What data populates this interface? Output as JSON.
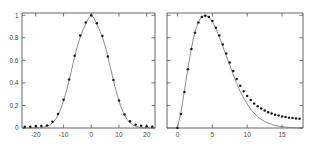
{
  "figure": {
    "background": "#ffffff",
    "curve_color": "#777777",
    "point_color": "#1a1a1a",
    "axis_color": "#555555",
    "width": 319,
    "height": 150
  },
  "chart_data": [
    {
      "type": "scatter",
      "panel": "left",
      "title": "",
      "xlabel": "",
      "ylabel": "",
      "xlim": [
        -25,
        23
      ],
      "ylim": [
        0,
        1.02
      ],
      "grid": false,
      "legend": null,
      "xticks": [
        -20,
        -10,
        0,
        10,
        20
      ],
      "xtick_labels": [
        "-20",
        "-10",
        "0",
        "10",
        "20"
      ],
      "yticks": [
        0,
        0.2,
        0.4,
        0.6,
        0.8,
        1
      ],
      "ytick_labels": [
        "0",
        "0.2",
        "0.4",
        "0.6",
        "0.8",
        "1"
      ],
      "series": [
        {
          "name": "model curve",
          "style": "line",
          "x": [
            -25,
            -24,
            -23,
            -22,
            -21,
            -20,
            -19,
            -18,
            -17,
            -16,
            -15,
            -14,
            -13,
            -12,
            -11,
            -10,
            -9,
            -8,
            -7,
            -6,
            -5,
            -4,
            -3,
            -2,
            -1,
            0,
            1,
            2,
            3,
            4,
            5,
            6,
            7,
            8,
            9,
            10,
            11,
            12,
            13,
            14,
            15,
            16,
            17,
            18,
            19,
            20,
            21,
            22,
            23
          ],
          "y": [
            0.0,
            0.0,
            0.0,
            0.0,
            0.001,
            0.001,
            0.002,
            0.004,
            0.008,
            0.015,
            0.027,
            0.046,
            0.074,
            0.114,
            0.169,
            0.24,
            0.325,
            0.423,
            0.527,
            0.631,
            0.726,
            0.806,
            0.868,
            0.923,
            0.974,
            1.0,
            0.974,
            0.923,
            0.868,
            0.806,
            0.726,
            0.631,
            0.527,
            0.423,
            0.325,
            0.24,
            0.169,
            0.114,
            0.074,
            0.046,
            0.027,
            0.015,
            0.008,
            0.004,
            0.002,
            0.001,
            0.001,
            0.0,
            0.0
          ]
        },
        {
          "name": "measured data",
          "style": "points",
          "x": [
            -24,
            -22,
            -20,
            -18,
            -16,
            -14,
            -12,
            -10,
            -8,
            -6,
            -4,
            -2,
            0,
            2,
            4,
            6,
            8,
            10,
            12,
            14,
            16,
            18,
            20,
            22
          ],
          "y": [
            0.01,
            0.012,
            0.015,
            0.018,
            0.022,
            0.055,
            0.125,
            0.25,
            0.43,
            0.64,
            0.82,
            0.935,
            1.0,
            0.93,
            0.815,
            0.635,
            0.425,
            0.245,
            0.12,
            0.06,
            0.028,
            0.02,
            0.016,
            0.012
          ]
        }
      ]
    },
    {
      "type": "scatter",
      "panel": "right",
      "title": "",
      "xlabel": "",
      "ylabel": "",
      "xlim": [
        -1.5,
        18
      ],
      "ylim": [
        0,
        1.02
      ],
      "grid": false,
      "legend": null,
      "xticks": [
        0,
        5,
        10,
        15
      ],
      "xtick_labels": [
        "0",
        "5",
        "10",
        "15"
      ],
      "yticks": [
        0,
        0.2,
        0.4,
        0.6,
        0.8,
        1
      ],
      "ytick_labels": [
        "",
        "",
        "",
        "",
        "",
        ""
      ],
      "series": [
        {
          "name": "model curve",
          "style": "line",
          "x": [
            -1.0,
            -0.5,
            0.0,
            0.5,
            1.0,
            1.5,
            2.0,
            2.5,
            3.0,
            3.5,
            4.0,
            4.5,
            5.0,
            5.5,
            6.0,
            6.5,
            7.0,
            7.5,
            8.0,
            8.5,
            9.0,
            9.5,
            10.0,
            10.5,
            11.0,
            11.5,
            12.0,
            12.5,
            13.0,
            13.5,
            14.0,
            14.5,
            15.0,
            15.5,
            16.0,
            16.5,
            17.0,
            17.5,
            18.0
          ],
          "y": [
            0.0,
            0.0,
            0.0,
            0.14,
            0.33,
            0.53,
            0.71,
            0.85,
            0.94,
            0.99,
            1.0,
            0.985,
            0.945,
            0.885,
            0.81,
            0.725,
            0.64,
            0.555,
            0.47,
            0.395,
            0.325,
            0.265,
            0.212,
            0.168,
            0.131,
            0.101,
            0.077,
            0.058,
            0.043,
            0.032,
            0.023,
            0.016,
            0.011,
            0.008,
            0.005,
            0.004,
            0.002,
            0.002,
            0.001
          ]
        },
        {
          "name": "measured data",
          "style": "points",
          "x": [
            0.0,
            0.5,
            1.0,
            1.5,
            2.0,
            2.5,
            3.0,
            3.5,
            4.0,
            4.5,
            5.0,
            5.5,
            6.0,
            6.5,
            7.0,
            7.5,
            8.0,
            8.5,
            9.0,
            9.5,
            10.0,
            10.5,
            11.0,
            11.5,
            12.0,
            12.5,
            13.0,
            13.5,
            14.0,
            14.5,
            15.0,
            15.5,
            16.0,
            16.5,
            17.0,
            17.5
          ],
          "y": [
            0.0,
            0.125,
            0.32,
            0.52,
            0.7,
            0.845,
            0.935,
            0.985,
            0.995,
            0.985,
            0.95,
            0.89,
            0.82,
            0.74,
            0.66,
            0.58,
            0.505,
            0.435,
            0.375,
            0.325,
            0.283,
            0.248,
            0.218,
            0.193,
            0.172,
            0.155,
            0.14,
            0.128,
            0.118,
            0.11,
            0.103,
            0.097,
            0.092,
            0.088,
            0.085,
            0.082
          ]
        }
      ]
    }
  ]
}
